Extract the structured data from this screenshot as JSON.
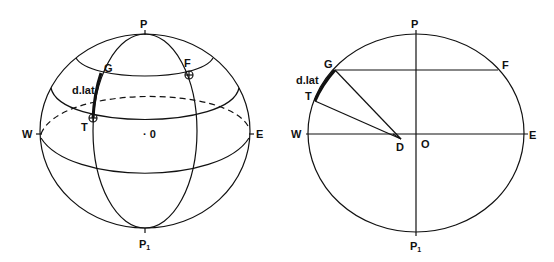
{
  "figures": {
    "left": {
      "title": "Sphere with meridian and parallels",
      "labels": {
        "pole_north": "P",
        "pole_south": "P",
        "pole_south_sub": "1",
        "west": "W",
        "east": "E",
        "center": "· 0",
        "point_g": "G",
        "point_f": "F",
        "point_t": "T",
        "arc": "d.lat"
      }
    },
    "right": {
      "title": "Meridian section",
      "labels": {
        "pole_north": "P",
        "pole_south": "P",
        "pole_south_sub": "1",
        "west": "W",
        "east": "E",
        "center": "O",
        "point_g": "G",
        "point_f": "F",
        "point_t": "T",
        "point_d": "D",
        "arc": "d.lat"
      }
    }
  }
}
